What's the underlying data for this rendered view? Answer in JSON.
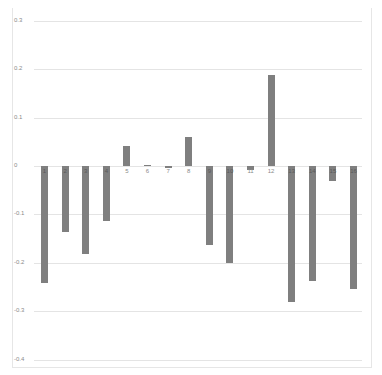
{
  "chart_data": {
    "type": "bar",
    "title": "",
    "xlabel": "",
    "ylabel": "",
    "categories": [
      "1",
      "2",
      "3",
      "4",
      "5",
      "6",
      "7",
      "8",
      "9",
      "10",
      "11",
      "12",
      "13",
      "14",
      "15",
      "16"
    ],
    "values": [
      -0.242,
      -0.136,
      -0.182,
      -0.114,
      0.041,
      0.002,
      -0.003,
      0.06,
      -0.163,
      -0.2,
      -0.008,
      0.188,
      -0.281,
      -0.238,
      -0.031,
      -0.254
    ],
    "ylim": [
      -0.4,
      0.3
    ],
    "yticks": [
      "0.3",
      "0.2",
      "0.1",
      "0",
      "-0.1",
      "-0.2",
      "-0.3",
      "-0.4"
    ],
    "grid": true,
    "legend": null,
    "bar_color": "#7f7f7f"
  }
}
